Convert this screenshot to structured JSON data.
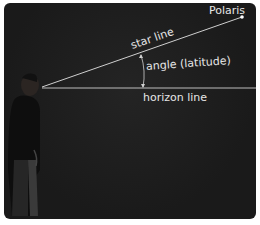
{
  "diagram": {
    "labels": {
      "star": "Polaris",
      "star_line": "star line",
      "angle": "angle (latitude)",
      "horizon": "horizon line"
    },
    "colors": {
      "background": "#1c1c1c",
      "lines": "#cfcfcf",
      "text": "#e6e6e6",
      "star": "#ffffff"
    }
  }
}
